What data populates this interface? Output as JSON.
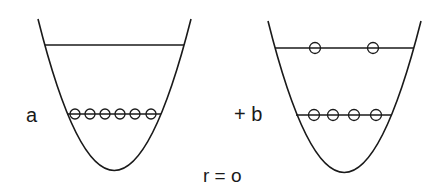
{
  "diagram": {
    "type": "harmonic-well-occupation",
    "stroke_color": "#1a1a1a",
    "labels": {
      "a": "a",
      "b": "+ b",
      "r": "r = o"
    },
    "wells": [
      {
        "name": "well-a",
        "levels": [
          {
            "name": "upper-level",
            "particles": 0
          },
          {
            "name": "lower-level",
            "particles": 6
          }
        ]
      },
      {
        "name": "well-b",
        "levels": [
          {
            "name": "upper-level",
            "particles": 2
          },
          {
            "name": "lower-level",
            "particles": 4
          }
        ]
      }
    ]
  }
}
